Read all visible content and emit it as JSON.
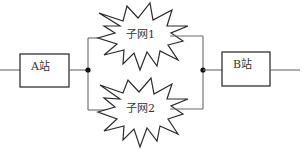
{
  "diagram": {
    "nodes": [
      {
        "id": "station-a",
        "label": "A站",
        "shape": "rectangle"
      },
      {
        "id": "subnet-1",
        "label": "子网1",
        "shape": "starburst"
      },
      {
        "id": "subnet-2",
        "label": "子网2",
        "shape": "starburst"
      },
      {
        "id": "station-b",
        "label": "B站",
        "shape": "rectangle"
      }
    ],
    "edges": [
      {
        "from": "input",
        "to": "station-a"
      },
      {
        "from": "station-a",
        "to": "junction-left"
      },
      {
        "from": "junction-left",
        "to": "subnet-1"
      },
      {
        "from": "junction-left",
        "to": "subnet-2"
      },
      {
        "from": "subnet-1",
        "to": "junction-right"
      },
      {
        "from": "subnet-2",
        "to": "junction-right"
      },
      {
        "from": "junction-right",
        "to": "station-b"
      },
      {
        "from": "station-b",
        "to": "output"
      }
    ],
    "colors": {
      "stroke": "#333333",
      "wire": "#6a6a6a",
      "background": "#ffffff"
    }
  }
}
